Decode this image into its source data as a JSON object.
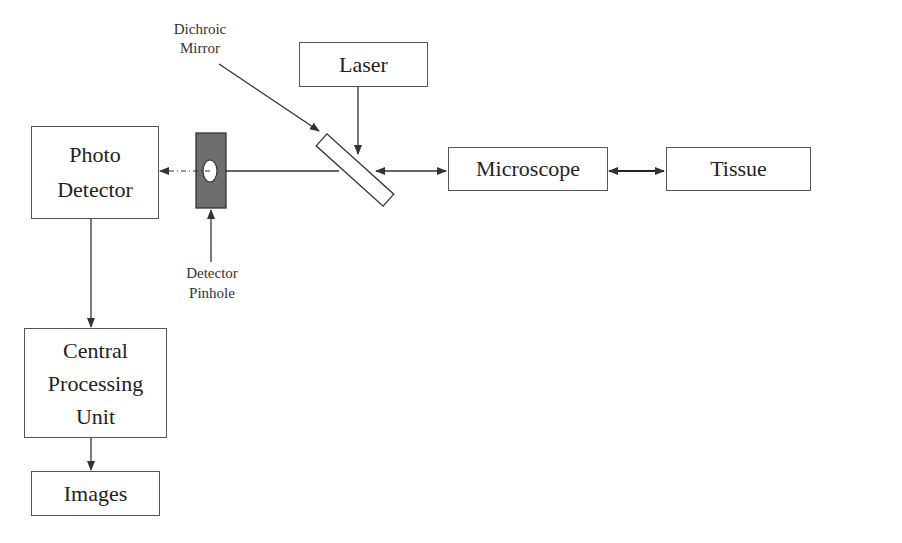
{
  "diagram": {
    "type": "confocal-microscope-block-diagram",
    "nodes": {
      "laser": {
        "label": "Laser"
      },
      "photo_detector": {
        "line1": "Photo",
        "line2": "Detector"
      },
      "microscope": {
        "label": "Microscope"
      },
      "tissue": {
        "label": "Tissue"
      },
      "cpu": {
        "line1": "Central",
        "line2": "Processing",
        "line3": "Unit"
      },
      "images": {
        "label": "Images"
      }
    },
    "annotations": {
      "dichroic_mirror": {
        "line1": "Dichroic",
        "line2": "Mirror"
      },
      "detector_pinhole": {
        "line1": "Detector",
        "line2": "Pinhole"
      }
    },
    "edges": [
      {
        "from": "Laser",
        "to": "Dichroic Mirror",
        "style": "solid",
        "direction": "one-way"
      },
      {
        "from": "Dichroic Mirror",
        "to": "Microscope",
        "style": "solid",
        "direction": "two-way"
      },
      {
        "from": "Microscope",
        "to": "Tissue",
        "style": "solid-bold",
        "direction": "two-way"
      },
      {
        "from": "Dichroic Mirror",
        "to": "Detector Pinhole",
        "style": "solid",
        "direction": "line"
      },
      {
        "from": "Detector Pinhole",
        "to": "Photo Detector",
        "style": "dash-dot",
        "direction": "one-way"
      },
      {
        "from": "Photo Detector",
        "to": "Central Processing Unit",
        "style": "solid",
        "direction": "one-way"
      },
      {
        "from": "Central Processing Unit",
        "to": "Images",
        "style": "solid",
        "direction": "one-way"
      }
    ],
    "colors": {
      "stroke": "#333333",
      "pinhole_fill": "#6e6e6e",
      "background": "#ffffff"
    }
  }
}
